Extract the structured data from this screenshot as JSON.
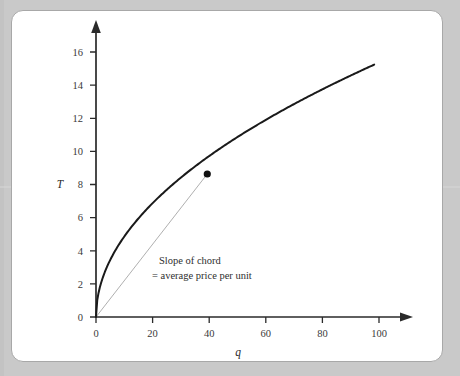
{
  "page": {
    "running_head": "",
    "background_color": "#c9c9c9",
    "panel_color": "#ffffff",
    "panel_border_color": "#a8a8a8"
  },
  "chart_data": {
    "type": "line",
    "title": "",
    "xlabel": "q",
    "ylabel": "T",
    "xlim": [
      0,
      110
    ],
    "ylim": [
      0,
      17
    ],
    "grid": false,
    "legend": "none",
    "xticks": [
      "0",
      "20",
      "40",
      "60",
      "80",
      "100"
    ],
    "xtick_values": [
      0,
      20,
      40,
      60,
      80,
      100
    ],
    "yticks": [
      "0",
      "2",
      "4",
      "6",
      "8",
      "10",
      "12",
      "14",
      "16"
    ],
    "ytick_values": [
      0,
      2,
      4,
      6,
      8,
      10,
      12,
      14,
      16
    ],
    "series": [
      {
        "name": "Total expenditure curve T(q)",
        "type": "curve",
        "color": "#1a1a1a",
        "linewidth": 2.0,
        "formula": "T = 1.5*sqrt(q)",
        "x": [
          0,
          2,
          5,
          10,
          15,
          20,
          25,
          30,
          35,
          40,
          45,
          50,
          55,
          60,
          65,
          70,
          75,
          80,
          85,
          90,
          95,
          100
        ],
        "y": [
          0,
          2.12,
          3.35,
          4.74,
          5.81,
          6.71,
          7.5,
          8.22,
          8.87,
          9.49,
          10.06,
          10.61,
          11.12,
          11.62,
          12.09,
          12.55,
          12.99,
          13.42,
          13.82,
          14.23,
          14.62,
          15.0
        ]
      },
      {
        "name": "Chord from origin",
        "type": "chord",
        "color": "#9a9a9a",
        "linewidth": 0.8,
        "x": [
          0,
          40
        ],
        "y": [
          0,
          8.5
        ]
      }
    ],
    "markers": [
      {
        "name": "chord-endpoint",
        "x": 40,
        "y": 8.5,
        "color": "#111111",
        "size": 5
      }
    ],
    "annotations": [
      {
        "name": "chord-annotation",
        "line1": "Slope of chord",
        "line2": "= average price per unit",
        "x": 21,
        "y": 4.0
      }
    ]
  }
}
